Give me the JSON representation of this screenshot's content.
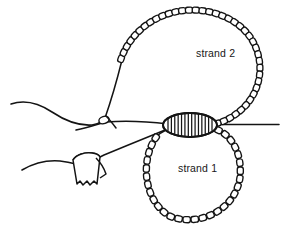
{
  "figure": {
    "kind": "line-drawing",
    "title_visible": false,
    "background_color": "#ffffff",
    "ink_color": "#141414",
    "width": 282,
    "height": 230
  },
  "labels": {
    "strand2": "strand 2",
    "strand1": "strand 1"
  },
  "label_positions": {
    "strand2": {
      "x": 196,
      "y": 57
    },
    "strand1": {
      "x": 178,
      "y": 172
    }
  },
  "elements": {
    "center_bead": {
      "name": "crimp-bead",
      "shape": "hatched-oval",
      "center_x": 190,
      "center_y": 125,
      "radius_x": 27,
      "radius_y": 12,
      "hatch_count": 14,
      "fill": "#ffffff"
    },
    "strand2_loop": {
      "name": "upper-beaded-loop",
      "bead_count": 40,
      "bead_size": 7.2
    },
    "strand1_loop": {
      "name": "lower-beaded-loop",
      "bead_count": 30,
      "bead_size": 7.4,
      "center_x": 192,
      "center_y": 172,
      "radius_x": 47,
      "radius_y": 48
    },
    "tag": {
      "name": "thread-tag",
      "x": 72,
      "y": 152,
      "width": 26,
      "height": 30
    },
    "small_loop_knot": {
      "name": "thread-crossing-loop",
      "x": 103,
      "y": 120,
      "radius": 5
    },
    "right_tail": {
      "name": "right-thread-tail",
      "from_x": 218,
      "to_x": 279,
      "y": 125
    },
    "left_tails": {
      "name": "left-thread-tails",
      "count": 2
    }
  },
  "colors": {
    "ink": "#141414",
    "background": "#ffffff",
    "text": "#171717"
  }
}
